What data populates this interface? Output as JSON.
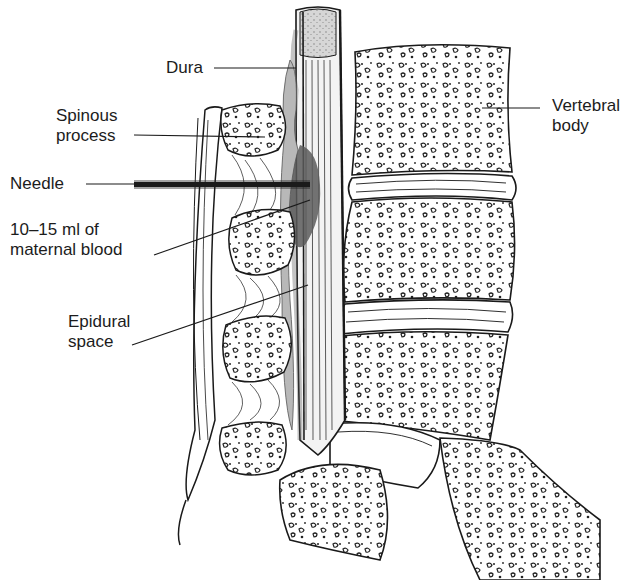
{
  "figure": {
    "labels": {
      "dura": "Dura",
      "spinous_process": "Spinous\nprocess",
      "needle": "Needle",
      "blood": "10–15 ml of\nmaternal blood",
      "epidural_space": "Epidural\nspace",
      "vertebral_body": "Vertebral\nbody"
    },
    "colors": {
      "ink": "#1a1a1a",
      "blood_patch": "#5a5a5a",
      "epidural_fat": "#b8b8b8",
      "csf_gray": "#c9c9c9"
    }
  }
}
